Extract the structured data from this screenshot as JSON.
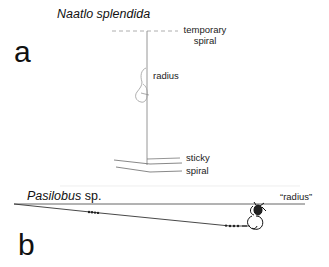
{
  "panel_a": {
    "letter": "a",
    "species": "Naatlo splendida",
    "labels": {
      "temporary_spiral_1": "temporary",
      "temporary_spiral_2": "spiral",
      "radius": "radius",
      "sticky_spiral_1": "sticky",
      "sticky_spiral_2": "spiral"
    }
  },
  "panel_b": {
    "letter": "b",
    "species_italic": "Pasilobus",
    "species_suffix": " sp.",
    "labels": {
      "radius": "“radius”"
    }
  },
  "colors": {
    "line_dark": "#2a2a2a",
    "line_light": "#9a9a9a",
    "text": "#111111"
  }
}
